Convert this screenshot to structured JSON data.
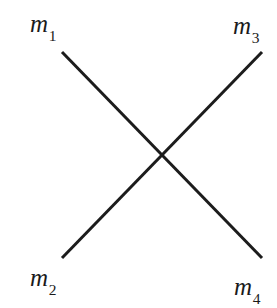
{
  "figure": {
    "kind": "crossing-lines-diagram",
    "width": 277,
    "height": 308,
    "background_color": "#ffffff",
    "stroke_color": "#1c1c1c",
    "stroke_width": 3,
    "labels": {
      "top_left": {
        "base": "m",
        "sub": "1",
        "text": "m1"
      },
      "top_right": {
        "base": "m",
        "sub": "3",
        "text": "m3"
      },
      "bottom_left": {
        "base": "m",
        "sub": "2",
        "text": "m2"
      },
      "bottom_right": {
        "base": "m",
        "sub": "4",
        "text": "m4"
      }
    },
    "lines": [
      {
        "name": "m1-to-m4",
        "x1": 62,
        "y1": 52,
        "x2": 262,
        "y2": 258
      },
      {
        "name": "m2-to-m3",
        "x1": 62,
        "y1": 258,
        "x2": 262,
        "y2": 52
      }
    ],
    "intersection": {
      "x": 163,
      "y": 153
    }
  }
}
